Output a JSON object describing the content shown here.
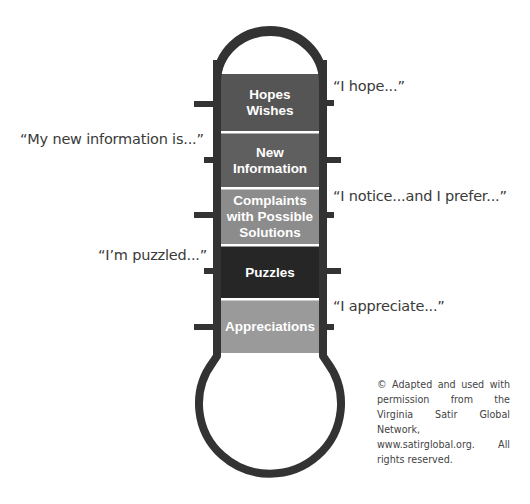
{
  "diagram": {
    "colors": {
      "outline": "#333333",
      "hopes": "#555555",
      "new_information": "#5f5f5f",
      "complaints": "#8c8c8c",
      "puzzles": "#262626",
      "appreciations": "#9a9a9a",
      "divider": "#ffffff",
      "label_text": "#ffffff",
      "quote_text": "#3a3a3a"
    },
    "sections": [
      {
        "id": "hopes",
        "lines": [
          "Hopes",
          "Wishes"
        ],
        "label": "Hopes Wishes"
      },
      {
        "id": "new_information",
        "lines": [
          "New",
          "Information"
        ],
        "label": "New Information"
      },
      {
        "id": "complaints",
        "lines": [
          "Complaints",
          "with Possible",
          "Solutions"
        ],
        "label": "Complaints with Possible Solutions"
      },
      {
        "id": "puzzles",
        "lines": [
          "Puzzles"
        ],
        "label": "Puzzles"
      },
      {
        "id": "appreciations",
        "lines": [
          "Appreciations"
        ],
        "label": "Appreciations"
      }
    ],
    "quotes": {
      "hopes": "“I hope...”",
      "new_information": "“My new information is...”",
      "complaints": "“I notice...and I prefer...”",
      "puzzles": "“I’m puzzled...”",
      "appreciations": "“I appreciate...”"
    },
    "credit": "© Adapted and used with permission from the Virginia Satir Global Network, www.satirglobal.org. All rights reserved."
  }
}
